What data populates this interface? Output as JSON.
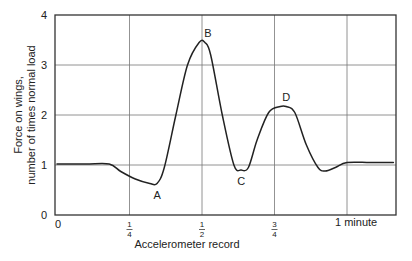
{
  "chart_data": {
    "type": "line",
    "title": "",
    "xlabel": "Accelerometer record",
    "ylabel_line1": "Force on wings,",
    "ylabel_line2": "number of times normal load",
    "ylim": [
      0,
      4
    ],
    "xlim": [
      0,
      1.16
    ],
    "grid": true,
    "legend": null,
    "y_ticks": [
      {
        "value": 0,
        "label": "0"
      },
      {
        "value": 1,
        "label": "1"
      },
      {
        "value": 2,
        "label": "2"
      },
      {
        "value": 3,
        "label": "3"
      },
      {
        "value": 4,
        "label": "4"
      }
    ],
    "x_ticks": [
      {
        "value": 0,
        "label": "0",
        "num": "",
        "den": ""
      },
      {
        "value": 0.25,
        "label": "1/4",
        "num": "1",
        "den": "4"
      },
      {
        "value": 0.5,
        "label": "1/2",
        "num": "1",
        "den": "2"
      },
      {
        "value": 0.75,
        "label": "3/4",
        "num": "3",
        "den": "4"
      },
      {
        "value": 1.0,
        "label": "1 minute",
        "num": "",
        "den": ""
      }
    ],
    "series": [
      {
        "name": "Force on wings",
        "x": [
          0.0,
          0.1,
          0.18,
          0.22,
          0.27,
          0.32,
          0.345,
          0.37,
          0.41,
          0.45,
          0.49,
          0.51,
          0.53,
          0.57,
          0.61,
          0.635,
          0.66,
          0.69,
          0.73,
          0.77,
          0.79,
          0.82,
          0.86,
          0.9,
          0.925,
          0.96,
          1.0,
          1.08,
          1.16
        ],
        "y": [
          1.02,
          1.02,
          1.02,
          0.87,
          0.72,
          0.63,
          0.63,
          0.95,
          2.0,
          3.0,
          3.45,
          3.45,
          3.2,
          2.0,
          1.0,
          0.9,
          0.95,
          1.5,
          2.05,
          2.17,
          2.17,
          2.05,
          1.4,
          0.95,
          0.88,
          0.95,
          1.05,
          1.05,
          1.05
        ]
      }
    ],
    "annotations": [
      {
        "label": "A",
        "x": 0.345,
        "y": 0.63,
        "position": "below"
      },
      {
        "label": "B",
        "x": 0.51,
        "y": 3.45,
        "position": "above"
      },
      {
        "label": "C",
        "x": 0.635,
        "y": 0.9,
        "position": "below"
      },
      {
        "label": "D",
        "x": 0.78,
        "y": 2.17,
        "position": "above"
      }
    ]
  }
}
